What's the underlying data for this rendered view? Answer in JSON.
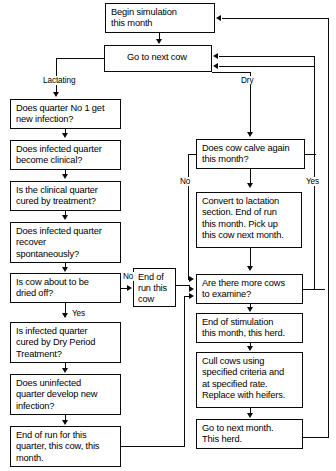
{
  "diagram": {
    "nodes": {
      "begin": "Begin simulation\nthis month",
      "next_cow": "Go to next cow",
      "q1_new_infection": "Does quarter No 1 get\nnew infection?",
      "infected_clinical": "Does infected quarter\nbecome clinical?",
      "clinical_cured": "Is the clinical quarter\ncured by treatment?",
      "recover_spont": "Does infected quarter\nrecover\nspontaneously?",
      "about_dried_off": "Is cow about to be\ndried off?",
      "dry_period_cured": "Is infected quarter\ncured by Dry Period\nTreatment?",
      "uninfected_new": "Does uninfected\nquarter develop new\ninfection?",
      "end_run_quarter": "End of run for this\nquarter, this cow, this\nmonth.",
      "end_run_cow": "End of\nrun this\ncow",
      "calve_again": "Does cow calve again\nthis month?",
      "convert_lactation": "Convert to lactation\nsection. End of run\nthis month. Pick up\nthis cow next month.",
      "more_cows": "Are there more cows\nto examine?",
      "end_stimulation": "End of stimulation\nthis month, this herd.",
      "cull_cows": "Cull cows using\nspecified criteria and\nat specified rate.\nReplace with heifers.",
      "next_month": "Go to next month.\nThis herd."
    },
    "edge_labels": {
      "lactating": "Lactating",
      "dry": "Dry",
      "no_dried_off": "No",
      "yes_dried_off": "Yes",
      "no_calve": "No",
      "yes_calve": "Yes"
    },
    "colors": {
      "stroke": "#0a0a0a",
      "background": "#ffffff",
      "text": "#000000"
    }
  }
}
